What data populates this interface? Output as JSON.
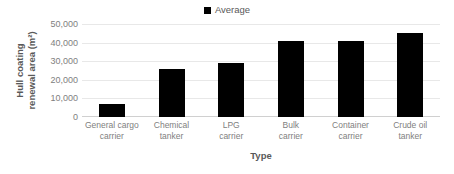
{
  "chart_data": {
    "type": "bar",
    "title": "",
    "xlabel": "Type",
    "ylabel": "Hull coating renewal area (m²)",
    "ylabel_line1": "Hull coating",
    "ylabel_line2": "renewal area (m²)",
    "categories": [
      "General cargo carrier",
      "Chemical tanker",
      "LPG carrier",
      "Bulk carrier",
      "Container carrier",
      "Crude oil tanker"
    ],
    "category_lines": [
      [
        "General cargo",
        "carrier"
      ],
      [
        "Chemical",
        "tanker"
      ],
      [
        "LPG",
        "carrier"
      ],
      [
        "Bulk",
        "carrier"
      ],
      [
        "Container",
        "carrier"
      ],
      [
        "Crude oil",
        "tanker"
      ]
    ],
    "series": [
      {
        "name": "Average",
        "color": "#000000",
        "values": [
          7000,
          26000,
          29000,
          41000,
          41000,
          45000
        ]
      }
    ],
    "values": [
      7000,
      26000,
      29000,
      41000,
      41000,
      45000
    ],
    "ylim": [
      0,
      50000
    ],
    "ytick_values": [
      50000,
      40000,
      30000,
      20000,
      10000,
      0
    ],
    "ytick_labels": [
      "50,000",
      "40,000",
      "30,000",
      "20,000",
      "10,000",
      "0"
    ],
    "grid": true,
    "legend_position": "top-center"
  },
  "legend": {
    "entries": [
      {
        "label": "Average",
        "color": "#000000"
      }
    ]
  },
  "colors": {
    "bar": "#000000",
    "gridline": "#e8e8e8",
    "tick_text": "#808080",
    "axis_title_text": "#595959",
    "background": "#ffffff"
  }
}
